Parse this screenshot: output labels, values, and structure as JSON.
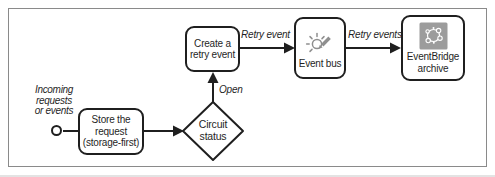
{
  "colors": {
    "ink": "#1f1f1f",
    "icon_gray": "#8f8f8f",
    "archive_icon_bg": "#9c9c9c",
    "frame_border": "#8a8a8a",
    "background": "#ffffff"
  },
  "nodes": {
    "start": {
      "label": {
        "line1": "Incoming",
        "line2": "requests",
        "line3": "or events"
      }
    },
    "store_request": {
      "line1": "Store the",
      "line2": "request",
      "line3": "(storage-first)"
    },
    "circuit_status": {
      "line1": "Circuit",
      "line2": "status"
    },
    "create_retry_event": {
      "line1": "Create a",
      "line2": "retry event"
    },
    "event_bus": {
      "label": "Event bus",
      "icon": "pencil-spark-icon"
    },
    "eventbridge_archive": {
      "line1": "EventBridge",
      "line2": "archive",
      "icon": "node-network-icon"
    }
  },
  "edge_labels": {
    "open": "Open",
    "retry_event": "Retry event",
    "retry_events": "Retry events"
  }
}
